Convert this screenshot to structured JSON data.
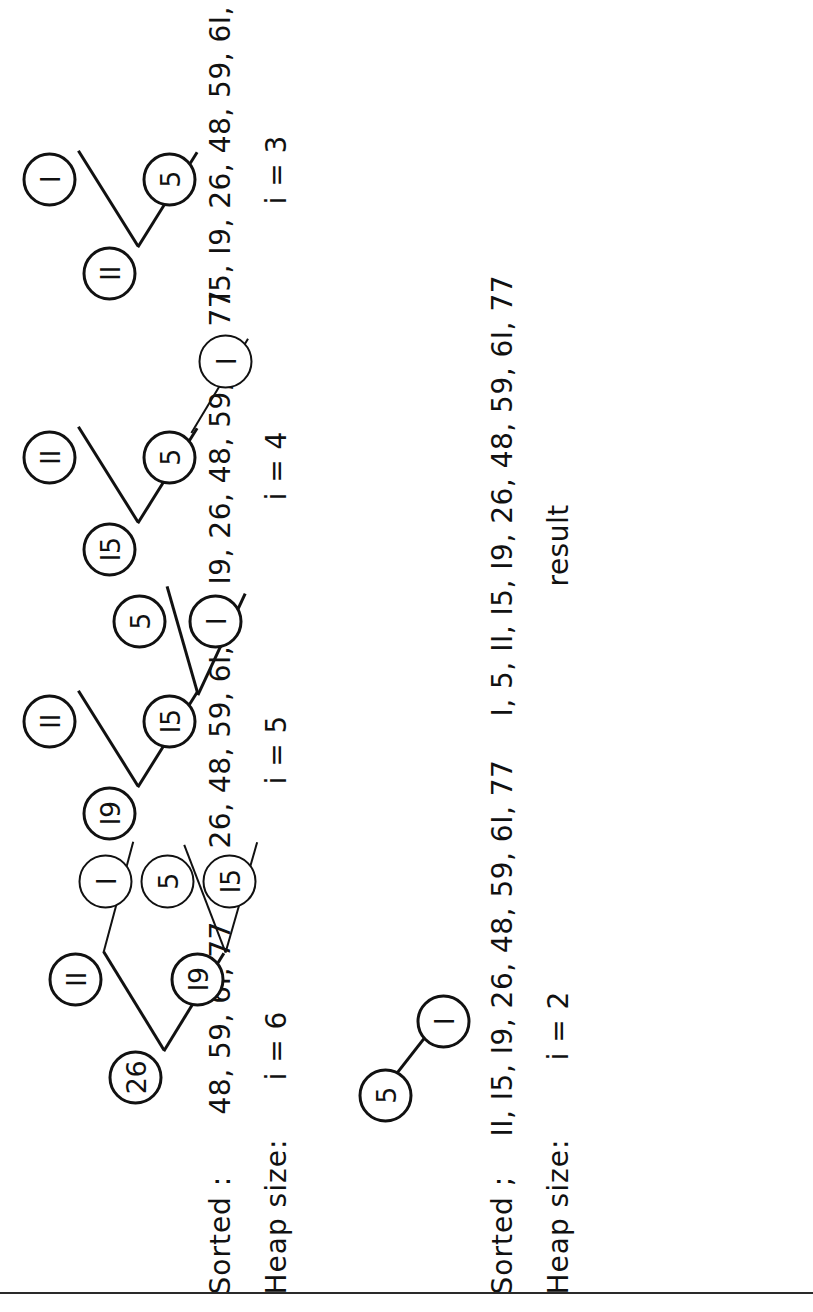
{
  "figure": {
    "orientation": "rotated-90-ccw",
    "row_labels": {
      "sorted": "Sorted :",
      "sorted_alt": "Sorted ;",
      "heap_size": "Heap size:"
    },
    "result_label": "result",
    "result_values": "I, 5, II, I5, I9, 26, 48, 59, 6I, 77"
  },
  "steps": [
    {
      "id": "step-i6",
      "heap_size": "i = 6",
      "sorted": "48, 59, 6I, 77",
      "nodes": [
        {
          "value": "26",
          "x": 30,
          "y": 118
        },
        {
          "value": "II",
          "x": 128,
          "y": 58
        },
        {
          "value": "I9",
          "x": 128,
          "y": 180
        },
        {
          "value": "I",
          "x": 226,
          "y": 88
        },
        {
          "value": "5",
          "x": 226,
          "y": 150
        },
        {
          "value": "I5",
          "x": 226,
          "y": 212
        }
      ],
      "edges": [
        {
          "from": 0,
          "to": 1
        },
        {
          "from": 0,
          "to": 2
        },
        {
          "from": 1,
          "to": 3
        },
        {
          "from": 2,
          "to": 4
        },
        {
          "from": 2,
          "to": 5
        }
      ]
    },
    {
      "id": "step-i5",
      "heap_size": "i = 5",
      "sorted": "26, 48, 59, 6I, 77",
      "nodes": [
        {
          "value": "I9",
          "x": 20,
          "y": 92
        },
        {
          "value": "II",
          "x": 112,
          "y": 32
        },
        {
          "value": "I5",
          "x": 112,
          "y": 152
        },
        {
          "value": "5",
          "x": 212,
          "y": 122
        },
        {
          "value": "I",
          "x": 212,
          "y": 198
        }
      ],
      "edges": [
        {
          "from": 0,
          "to": 1
        },
        {
          "from": 0,
          "to": 2
        },
        {
          "from": 2,
          "to": 3
        },
        {
          "from": 2,
          "to": 4
        }
      ]
    },
    {
      "id": "step-i4",
      "heap_size": "i = 4",
      "sorted": "I9, 26, 48, 59, 6I, 77",
      "nodes": [
        {
          "value": "I5",
          "x": 20,
          "y": 92
        },
        {
          "value": "II",
          "x": 112,
          "y": 32
        },
        {
          "value": "5",
          "x": 112,
          "y": 152
        },
        {
          "value": "I",
          "x": 208,
          "y": 208
        }
      ],
      "edges": [
        {
          "from": 0,
          "to": 1
        },
        {
          "from": 0,
          "to": 2
        },
        {
          "from": 2,
          "to": 3
        }
      ]
    },
    {
      "id": "step-i3",
      "heap_size": "i = 3",
      "sorted": "I5, I9, 26, 48, 59, 6I, 77",
      "nodes": [
        {
          "value": "II",
          "x": 12,
          "y": 92
        },
        {
          "value": "I",
          "x": 106,
          "y": 32
        },
        {
          "value": "5",
          "x": 106,
          "y": 152
        }
      ],
      "edges": [
        {
          "from": 0,
          "to": 1
        },
        {
          "from": 0,
          "to": 2
        }
      ]
    },
    {
      "id": "step-i2",
      "heap_size": "i = 2",
      "sorted": "II, I5, I9, 26, 48, 59, 6I, 77",
      "nodes": [
        {
          "value": "5",
          "x": 12,
          "y": 28
        },
        {
          "value": "I",
          "x": 86,
          "y": 86
        }
      ],
      "edges": [
        {
          "from": 0,
          "to": 1
        }
      ]
    }
  ]
}
